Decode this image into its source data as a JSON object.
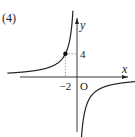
{
  "problem_label": "(4)",
  "chart_data": {
    "type": "line",
    "title": "",
    "function": "y = -8/x",
    "xlabel": "x",
    "ylabel": "y",
    "origin_label": "O",
    "xlim": [
      -12,
      10
    ],
    "ylim": [
      -12,
      12
    ],
    "x_ticks": [
      {
        "value": -2,
        "label": "−2"
      }
    ],
    "y_ticks": [
      {
        "value": 4,
        "label": "4"
      }
    ],
    "marked_points": [
      {
        "x": -2,
        "y": 4
      }
    ],
    "guide_lines": "dotted lines from (-2,4) to both axes",
    "series": [
      {
        "name": "left-branch",
        "x_range": [
          -12,
          -0.7
        ]
      },
      {
        "name": "right-branch",
        "x_range": [
          0.7,
          10
        ]
      }
    ],
    "grid": false,
    "legend": "none"
  }
}
